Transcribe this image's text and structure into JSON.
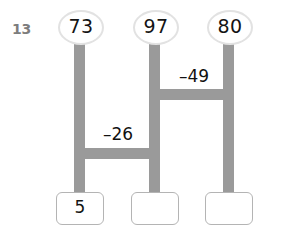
{
  "worksheet": {
    "problem_number": "13",
    "type": "bar-model-subtraction-chain",
    "colors": {
      "bar_gray": "#9a9a9a",
      "oval_border": "#e2e2e2",
      "box_border": "#b4b4b4",
      "number_text": "#141414",
      "problem_number_text": "#7d7d7d",
      "background": "#ffffff"
    },
    "top_nodes": [
      {
        "id": "node-1",
        "value": "73"
      },
      {
        "id": "node-2",
        "value": "97"
      },
      {
        "id": "node-3",
        "value": "80"
      }
    ],
    "operations": [
      {
        "id": "op-upper",
        "label": "–49",
        "connects": "node-2-to-node-3"
      },
      {
        "id": "op-lower",
        "label": "–26",
        "connects": "node-1-to-node-2"
      }
    ],
    "answer_boxes": [
      {
        "id": "answer-1",
        "value": "5",
        "filled": true
      },
      {
        "id": "answer-2",
        "value": "",
        "filled": false
      },
      {
        "id": "answer-3",
        "value": "",
        "filled": false
      }
    ]
  }
}
